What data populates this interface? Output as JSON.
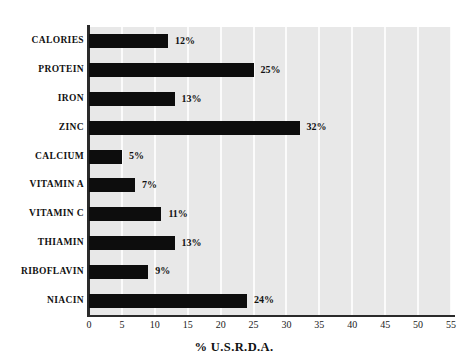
{
  "chart_data": {
    "type": "bar",
    "orientation": "horizontal",
    "title": "",
    "subtitle": "",
    "xlabel": "% U.S.R.D.A.",
    "ylabel": "",
    "categories": [
      "CALORIES",
      "PROTEIN",
      "IRON",
      "ZINC",
      "CALCIUM",
      "VITAMIN A",
      "VITAMIN C",
      "THIAMIN",
      "RIBOFLAVIN",
      "NIACIN"
    ],
    "values": [
      12,
      25,
      13,
      32,
      5,
      7,
      11,
      13,
      9,
      24
    ],
    "data_labels": [
      "12%",
      "25%",
      "13%",
      "32%",
      "5%",
      "7%",
      "11%",
      "13%",
      "9%",
      "24%"
    ],
    "xlim": [
      0,
      55
    ],
    "xticks": [
      0,
      5,
      10,
      15,
      20,
      25,
      30,
      35,
      40,
      45,
      50,
      55
    ],
    "xtick_labels": [
      "0",
      "5",
      "10",
      "15",
      "20",
      "25",
      "30",
      "35",
      "40",
      "45",
      "50",
      "55"
    ],
    "grid": "vertical",
    "legend": "none",
    "colors": {
      "bar": "#0d0d0d",
      "plot_background": "#e8e8e8",
      "gridline": "#fbfbfb",
      "axis": "#2a2a2a",
      "text": "#111111",
      "page_background": "#ffffff"
    }
  }
}
